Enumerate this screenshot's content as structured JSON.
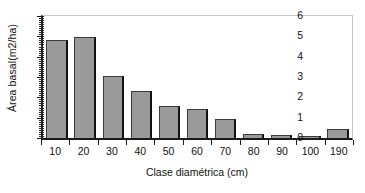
{
  "chart_data": {
    "type": "bar",
    "title": "",
    "xlabel": "Clase diamétrica (cm)",
    "ylabel": "Área basal(m2/ha)",
    "categories": [
      "10",
      "20",
      "30",
      "40",
      "50",
      "60",
      "70",
      "80",
      "90",
      "100",
      "190"
    ],
    "values": [
      4.8,
      4.95,
      3.05,
      2.3,
      1.55,
      1.45,
      0.95,
      0.22,
      0.15,
      0.12,
      0.42
    ],
    "ylim": [
      0,
      6
    ],
    "y_ticks": [
      "0",
      "1",
      "2",
      "3",
      "4",
      "5",
      "6"
    ],
    "y_minor_step": 0.1,
    "grid": false,
    "legend": "none",
    "bar_color": "#9a9a9a",
    "bar_edge_color": "#3b3b3b",
    "axis_color": "#1b1b1b",
    "frame_color": "#c8c8c8",
    "background": "#ffffff"
  }
}
